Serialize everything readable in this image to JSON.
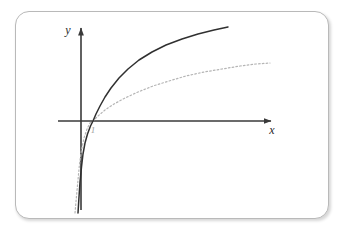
{
  "figure": {
    "card": {
      "background_color": "#ffffff",
      "border_color": "#b9b9b9"
    },
    "axes": {
      "x_label": "x",
      "y_label": "y",
      "x_axis_color": "#3a3a3a",
      "y_axis_color": "#3a3a3a",
      "origin_px": {
        "x": 65,
        "y": 109
      },
      "x_arrow_tip_px": {
        "x": 257,
        "y": 109
      },
      "y_arrow_tip_px": {
        "x": 65,
        "y": 14
      }
    },
    "tick": {
      "label": "1",
      "color": "#9a9a9a",
      "position_px": {
        "x": 77,
        "y": 118
      }
    }
  },
  "chart_data": {
    "type": "line",
    "title": "",
    "xlabel": "x",
    "ylabel": "y",
    "grid": false,
    "legend": null,
    "xlim": [
      0,
      9
    ],
    "ylim": [
      -6,
      3
    ],
    "x_intercept": 1,
    "series": [
      {
        "name": "solid-logarithm-curve",
        "style": "solid",
        "color": "#303030",
        "width": 1.5,
        "points_px": [
          [
            62,
            201
          ],
          [
            63,
            185
          ],
          [
            64,
            170
          ],
          [
            65.5,
            155
          ],
          [
            67,
            142
          ],
          [
            69,
            131
          ],
          [
            71.5,
            122
          ],
          [
            74.5,
            114
          ],
          [
            77,
            109
          ],
          [
            80,
            102
          ],
          [
            84,
            94
          ],
          [
            89,
            85
          ],
          [
            95,
            76
          ],
          [
            103,
            66
          ],
          [
            112,
            57
          ],
          [
            123,
            48
          ],
          [
            136,
            40
          ],
          [
            150,
            33
          ],
          [
            166,
            27
          ],
          [
            182,
            22
          ],
          [
            198,
            18
          ],
          [
            212,
            15
          ]
        ]
      },
      {
        "name": "dotted-logarithm-curve",
        "style": "dotted",
        "color": "#b5b5b5",
        "width": 1.2,
        "points_px": [
          [
            59,
            201
          ],
          [
            60.5,
            184
          ],
          [
            62,
            168
          ],
          [
            63.5,
            152
          ],
          [
            65.5,
            138
          ],
          [
            68,
            126
          ],
          [
            71,
            117
          ],
          [
            74,
            111
          ],
          [
            77,
            109
          ],
          [
            82,
            104
          ],
          [
            89,
            98
          ],
          [
            98,
            92
          ],
          [
            109,
            86
          ],
          [
            122,
            80
          ],
          [
            137,
            74
          ],
          [
            153,
            69
          ],
          [
            170,
            64
          ],
          [
            188,
            60
          ],
          [
            206,
            57
          ],
          [
            224,
            54
          ],
          [
            240,
            52
          ],
          [
            254,
            51
          ]
        ]
      }
    ]
  }
}
